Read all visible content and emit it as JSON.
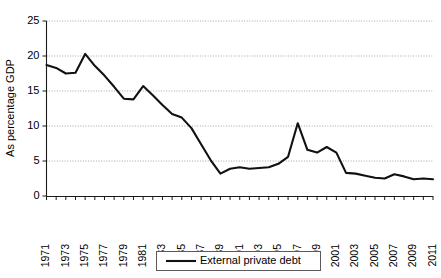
{
  "chart_data": {
    "type": "line",
    "title": "",
    "xlabel": "",
    "ylabel": "As percentage GDP",
    "ylim": [
      0,
      25
    ],
    "ytick_values": [
      0,
      5,
      10,
      15,
      20,
      25
    ],
    "ytick_labels": [
      "0",
      "5",
      "10",
      "15",
      "20",
      "25"
    ],
    "grid": "horizontal-dotted",
    "legend_position": "bottom-center",
    "xlim": [
      1971,
      2011
    ],
    "x": [
      1971,
      1972,
      1973,
      1974,
      1975,
      1976,
      1977,
      1978,
      1979,
      1980,
      1981,
      1982,
      1983,
      1984,
      1985,
      1986,
      1987,
      1988,
      1989,
      1990,
      1991,
      1992,
      1993,
      1994,
      1995,
      1996,
      1997,
      1998,
      1999,
      2000,
      2001,
      2002,
      2003,
      2004,
      2005,
      2006,
      2007,
      2008,
      2009,
      2010,
      2011
    ],
    "xtick_labels": [
      "1971",
      "1973",
      "1975",
      "1977",
      "1979",
      "1981",
      "1983",
      "1985",
      "1987",
      "1989",
      "1991",
      "1993",
      "1995",
      "1997",
      "1999",
      "2001",
      "2003",
      "2005",
      "2007",
      "2009",
      "2011"
    ],
    "series": [
      {
        "name": "External private debt",
        "color": "#111111",
        "values": [
          18.7,
          18.3,
          17.5,
          17.6,
          20.3,
          18.6,
          17.2,
          15.6,
          13.9,
          13.8,
          15.7,
          14.4,
          13.0,
          11.7,
          11.2,
          9.7,
          7.4,
          5.1,
          3.2,
          3.9,
          4.1,
          3.9,
          4.0,
          4.1,
          4.6,
          5.6,
          10.4,
          6.6,
          6.2,
          7.0,
          6.2,
          3.3,
          3.2,
          2.9,
          2.6,
          2.5,
          3.1,
          2.8,
          2.4,
          2.5,
          2.4
        ]
      }
    ]
  },
  "legend": {
    "entries": [
      {
        "label": "External private debt"
      }
    ]
  }
}
